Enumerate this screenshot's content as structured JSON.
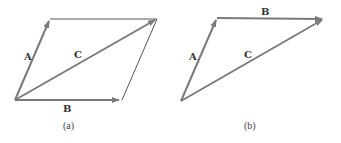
{
  "figure": {
    "colors": {
      "vector": "#7a7a7a",
      "outline": "#555555",
      "label": "#333333",
      "background": "#ffffff"
    },
    "panels": [
      {
        "id": "a",
        "caption": "(a)",
        "description": "Parallelogram method of vector addition",
        "vectors": [
          {
            "label": "A",
            "from": [
              15,
              100
            ],
            "to": [
              50,
              19
            ]
          },
          {
            "label": "B",
            "from": [
              15,
              100
            ],
            "to": [
              122,
              100
            ]
          },
          {
            "label": "C",
            "from": [
              15,
              100
            ],
            "to": [
              157,
              19
            ]
          }
        ],
        "outline_sides": [
          {
            "from": [
              50,
              19
            ],
            "to": [
              157,
              19
            ]
          },
          {
            "from": [
              122,
              100
            ],
            "to": [
              157,
              19
            ]
          }
        ]
      },
      {
        "id": "b",
        "caption": "(b)",
        "description": "Triangle (head-to-tail) method of vector addition",
        "vectors": [
          {
            "label": "A",
            "from": [
              181,
              101
            ],
            "to": [
              217,
              18
            ]
          },
          {
            "label": "B",
            "from": [
              217,
              18
            ],
            "to": [
              324,
              19
            ]
          },
          {
            "label": "C",
            "from": [
              181,
              101
            ],
            "to": [
              324,
              19
            ]
          }
        ]
      }
    ],
    "labels": {
      "a_A": "A",
      "a_B": "B",
      "a_C": "C",
      "a_caption": "(a)",
      "b_A": "A",
      "b_B": "B",
      "b_C": "C",
      "b_caption": "(b)"
    }
  }
}
